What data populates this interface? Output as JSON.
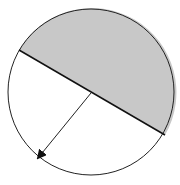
{
  "diagram": {
    "type": "circle-with-diameter-and-radius",
    "circle": {
      "cx": 91,
      "cy": 92,
      "r": 83,
      "stroke": "#222222",
      "fill": "#ffffff"
    },
    "diameter": {
      "x1": 19,
      "y1": 50,
      "x2": 165,
      "y2": 135,
      "stroke": "#111111"
    },
    "shaded_region": {
      "fill": "#c8c8c8",
      "side": "upper"
    },
    "radius_arrow": {
      "x1": 91,
      "y1": 93,
      "x2": 38,
      "y2": 158,
      "stroke": "#222222"
    }
  }
}
